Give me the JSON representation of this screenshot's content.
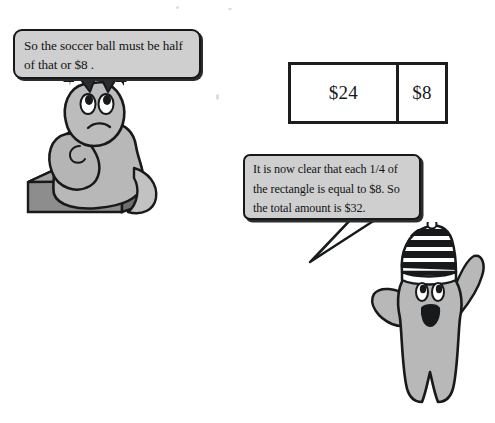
{
  "page": {
    "background_color": "#ffffff",
    "ink_color": "#16181a",
    "bubble_fill": "#cfcfcf",
    "character_fill": "#b8b8b8"
  },
  "bubbles": [
    {
      "id": "left",
      "speaker": "sitting-character",
      "text": "So the soccer ball must be half of that or $8 ."
    },
    {
      "id": "right",
      "speaker": "standing-character",
      "line1": "It is now clear that each 1/4 of",
      "line2": "the rectangle is equal to $8. So",
      "line3": "the total amount is $32."
    }
  ],
  "diagram": {
    "type": "bar-model",
    "cells": [
      {
        "label": "$24",
        "fraction_of_whole": 0.75
      },
      {
        "label": "$8",
        "fraction_of_whole": 0.25
      }
    ],
    "total": "$32"
  },
  "characters": [
    {
      "id": "left",
      "name": "sitting-character",
      "accessory": "black-hair",
      "pose": "seated-on-block",
      "expression": "thinking"
    },
    {
      "id": "right",
      "name": "standing-character",
      "accessory": "striped-stocking-cap",
      "pose": "arms-raised",
      "expression": "excited"
    }
  ]
}
